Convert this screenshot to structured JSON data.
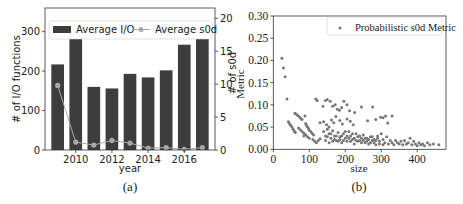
{
  "chart_data": [
    {
      "id": "a",
      "type": "bar",
      "caption": "(a)",
      "title": "",
      "xlabel": "year",
      "ylabel": "# of I/O functions",
      "y2label": "# of s0d",
      "categories": [
        2009,
        2010,
        2011,
        2012,
        2013,
        2014,
        2015,
        2016,
        2017
      ],
      "x_ticks": [
        "2010",
        "2012",
        "2014",
        "2016"
      ],
      "y_ticks": [
        "0",
        "100",
        "200",
        "300"
      ],
      "y2_ticks": [
        "0",
        "5",
        "10",
        "15",
        "20"
      ],
      "ylim": [
        0,
        360
      ],
      "y2lim": [
        0,
        20
      ],
      "series": [
        {
          "name": "Average I/O",
          "type": "bar",
          "axis": "left",
          "color": "#3d3d3d",
          "values": [
            217,
            310,
            160,
            156,
            193,
            184,
            202,
            267,
            302
          ]
        },
        {
          "name": "Average s0d",
          "type": "line",
          "axis": "right",
          "color": "#a8a8a8",
          "values": [
            9.8,
            1.2,
            0.75,
            1.45,
            1.05,
            0.3,
            0.35,
            0.1,
            0.35
          ]
        }
      ],
      "legend_position": "upper center",
      "grid": false
    },
    {
      "id": "b",
      "type": "scatter",
      "caption": "(b)",
      "title": "",
      "xlabel": "size",
      "ylabel": "# of s0d Metric",
      "x_ticks": [
        "0",
        "100",
        "200",
        "300",
        "400"
      ],
      "y_ticks": [
        "0.00",
        "0.05",
        "0.10",
        "0.15",
        "0.20",
        "0.25",
        "0.30"
      ],
      "xlim": [
        0,
        480
      ],
      "ylim": [
        0,
        0.3
      ],
      "legend_position": "upper right",
      "grid": false,
      "series": [
        {
          "name": "Probabilistic s0d Metric",
          "color": "#777777",
          "points": [
            [
              24,
              0.205
            ],
            [
              28,
              0.183
            ],
            [
              33,
              0.163
            ],
            [
              38,
              0.113
            ],
            [
              42,
              0.062
            ],
            [
              45,
              0.058
            ],
            [
              48,
              0.054
            ],
            [
              52,
              0.05
            ],
            [
              55,
              0.045
            ],
            [
              58,
              0.041
            ],
            [
              61,
              0.038
            ],
            [
              60,
              0.081
            ],
            [
              64,
              0.079
            ],
            [
              68,
              0.076
            ],
            [
              72,
              0.073
            ],
            [
              76,
              0.07
            ],
            [
              80,
              0.067
            ],
            [
              88,
              0.075
            ],
            [
              70,
              0.048
            ],
            [
              75,
              0.044
            ],
            [
              80,
              0.04
            ],
            [
              85,
              0.036
            ],
            [
              90,
              0.058
            ],
            [
              92,
              0.054
            ],
            [
              95,
              0.05
            ],
            [
              98,
              0.047
            ],
            [
              100,
              0.043
            ],
            [
              104,
              0.04
            ],
            [
              108,
              0.036
            ],
            [
              112,
              0.032
            ],
            [
              85,
              0.03
            ],
            [
              90,
              0.033
            ],
            [
              95,
              0.028
            ],
            [
              100,
              0.025
            ],
            [
              110,
              0.022
            ],
            [
              115,
              0.018
            ],
            [
              120,
              0.015
            ],
            [
              125,
              0.02
            ],
            [
              130,
              0.024
            ],
            [
              118,
              0.113
            ],
            [
              122,
              0.11
            ],
            [
              130,
              0.06
            ],
            [
              138,
              0.097
            ],
            [
              145,
              0.11
            ],
            [
              150,
              0.112
            ],
            [
              158,
              0.108
            ],
            [
              165,
              0.097
            ],
            [
              172,
              0.1
            ],
            [
              178,
              0.09
            ],
            [
              184,
              0.088
            ],
            [
              190,
              0.094
            ],
            [
              196,
              0.108
            ],
            [
              205,
              0.1
            ],
            [
              212,
              0.087
            ],
            [
              226,
              0.083
            ],
            [
              140,
              0.062
            ],
            [
              148,
              0.055
            ],
            [
              155,
              0.05
            ],
            [
              162,
              0.066
            ],
            [
              168,
              0.06
            ],
            [
              174,
              0.074
            ],
            [
              185,
              0.065
            ],
            [
              192,
              0.057
            ],
            [
              205,
              0.068
            ],
            [
              214,
              0.063
            ],
            [
              222,
              0.055
            ],
            [
              245,
              0.095
            ],
            [
              262,
              0.064
            ],
            [
              276,
              0.095
            ],
            [
              285,
              0.067
            ],
            [
              298,
              0.072
            ],
            [
              305,
              0.071
            ],
            [
              312,
              0.075
            ],
            [
              318,
              0.059
            ],
            [
              330,
              0.075
            ],
            [
              140,
              0.04
            ],
            [
              145,
              0.03
            ],
            [
              150,
              0.045
            ],
            [
              155,
              0.035
            ],
            [
              160,
              0.025
            ],
            [
              165,
              0.042
            ],
            [
              170,
              0.03
            ],
            [
              175,
              0.02
            ],
            [
              180,
              0.038
            ],
            [
              185,
              0.028
            ],
            [
              190,
              0.015
            ],
            [
              195,
              0.035
            ],
            [
              200,
              0.025
            ],
            [
              205,
              0.018
            ],
            [
              210,
              0.04
            ],
            [
              215,
              0.03
            ],
            [
              220,
              0.022
            ],
            [
              225,
              0.012
            ],
            [
              230,
              0.035
            ],
            [
              235,
              0.028
            ],
            [
              240,
              0.02
            ],
            [
              245,
              0.015
            ],
            [
              250,
              0.032
            ],
            [
              255,
              0.025
            ],
            [
              260,
              0.018
            ],
            [
              265,
              0.012
            ],
            [
              270,
              0.028
            ],
            [
              275,
              0.02
            ],
            [
              280,
              0.015
            ],
            [
              285,
              0.01
            ],
            [
              290,
              0.025
            ],
            [
              295,
              0.018
            ],
            [
              300,
              0.035
            ],
            [
              305,
              0.022
            ],
            [
              310,
              0.015
            ],
            [
              315,
              0.028
            ],
            [
              320,
              0.012
            ],
            [
              325,
              0.02
            ],
            [
              330,
              0.015
            ],
            [
              335,
              0.01
            ],
            [
              145,
              0.02
            ],
            [
              155,
              0.015
            ],
            [
              165,
              0.018
            ],
            [
              175,
              0.03
            ],
            [
              185,
              0.022
            ],
            [
              195,
              0.02
            ],
            [
              205,
              0.03
            ],
            [
              215,
              0.018
            ],
            [
              225,
              0.025
            ],
            [
              235,
              0.018
            ],
            [
              245,
              0.025
            ],
            [
              255,
              0.015
            ],
            [
              265,
              0.022
            ],
            [
              275,
              0.028
            ],
            [
              285,
              0.02
            ],
            [
              295,
              0.012
            ],
            [
              305,
              0.01
            ],
            [
              150,
              0.028
            ],
            [
              160,
              0.035
            ],
            [
              170,
              0.022
            ],
            [
              180,
              0.018
            ],
            [
              190,
              0.03
            ],
            [
              200,
              0.04
            ],
            [
              210,
              0.025
            ],
            [
              220,
              0.035
            ],
            [
              230,
              0.02
            ],
            [
              240,
              0.03
            ],
            [
              250,
              0.02
            ],
            [
              260,
              0.025
            ],
            [
              270,
              0.015
            ],
            [
              280,
              0.022
            ],
            [
              290,
              0.03
            ],
            [
              340,
              0.02
            ],
            [
              345,
              0.015
            ],
            [
              350,
              0.012
            ],
            [
              355,
              0.018
            ],
            [
              360,
              0.01
            ],
            [
              365,
              0.02
            ],
            [
              370,
              0.012
            ],
            [
              375,
              0.015
            ],
            [
              380,
              0.025
            ],
            [
              385,
              0.01
            ],
            [
              390,
              0.018
            ],
            [
              395,
              0.012
            ],
            [
              400,
              0.008
            ],
            [
              405,
              0.015
            ],
            [
              410,
              0.01
            ],
            [
              415,
              0.012
            ],
            [
              420,
              0.008
            ],
            [
              428,
              0.015
            ],
            [
              435,
              0.01
            ],
            [
              445,
              0.012
            ],
            [
              460,
              0.01
            ]
          ]
        }
      ]
    }
  ]
}
